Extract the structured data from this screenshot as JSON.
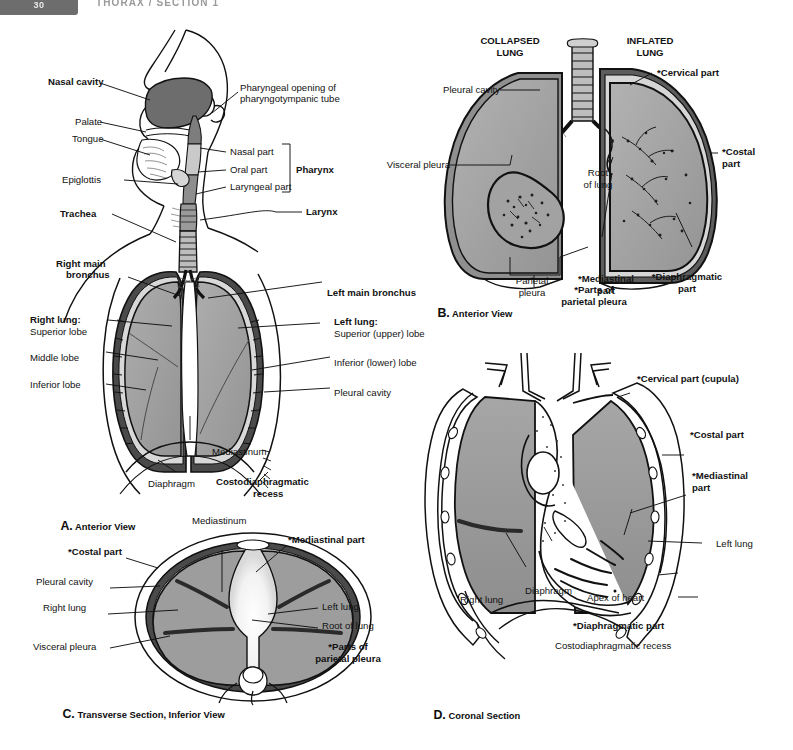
{
  "header": {
    "page_tab": "30",
    "title": "THORAX / SECTION 1"
  },
  "figure": {
    "panels": [
      {
        "id": "A",
        "letter": "A.",
        "caption": "Anterior View",
        "labels": [
          "Nasal cavity",
          "Pharyngeal opening of",
          "pharyngotympanic tube",
          "Palate",
          "Tongue",
          "Nasal part",
          "Oral part",
          "Laryngeal part",
          "Pharynx",
          "Epiglottis",
          "Larynx",
          "Trachea",
          "Right main",
          "bronchus",
          "Left main bronchus",
          "Right lung:",
          "Superior lobe",
          "Middle lobe",
          "Inferior lobe",
          "Left lung:",
          "Superior (upper) lobe",
          "Inferior (lower) lobe",
          "Pleural cavity",
          "Mediastinum",
          "Diaphragm",
          "Costodiaphragmatic",
          "recess"
        ]
      },
      {
        "id": "B",
        "letter": "B.",
        "caption": "Anterior View",
        "labels": [
          "COLLAPSED",
          "LUNG",
          "INFLATED",
          "LUNG",
          "Pleural cavity",
          "Visceral pleura",
          "Root",
          "of lung",
          "Parietal",
          "pleura",
          "*Cervical part",
          "*Costal",
          "part",
          "*Mediastinal",
          "part",
          "*Diaphragmatic",
          "part",
          "*Parts of",
          "parietal pleura"
        ]
      },
      {
        "id": "C",
        "letter": "C.",
        "caption": "Transverse Section, Inferior View",
        "labels": [
          "Mediastinum",
          "*Mediastinal part",
          "*Costal part",
          "Pleural cavity",
          "Right lung",
          "Visceral pleura",
          "Left lung",
          "Root of lung",
          "*Parts of",
          "parietal pleura"
        ]
      },
      {
        "id": "D",
        "letter": "D.",
        "caption": "Coronal Section",
        "labels": [
          "*Cervical part (cupula)",
          "*Costal part",
          "*Mediastinal",
          "part",
          "Left lung",
          "Right lung",
          "Diaphragm",
          "Apex of heart",
          "*Diaphragmatic part",
          "Costodiaphragmatic recess"
        ]
      }
    ]
  },
  "panelA": {
    "nasal_cavity": "Nasal cavity",
    "pharyngeal_opening_1": "Pharyngeal opening of",
    "pharyngeal_opening_2": "pharyngotympanic tube",
    "palate": "Palate",
    "tongue": "Tongue",
    "nasal_part": "Nasal part",
    "oral_part": "Oral part",
    "laryngeal_part": "Laryngeal part",
    "pharynx": "Pharynx",
    "epiglottis": "Epiglottis",
    "larynx": "Larynx",
    "trachea": "Trachea",
    "right_main_1": "Right main",
    "right_main_2": "bronchus",
    "left_main": "Left main bronchus",
    "right_lung_head": "Right lung:",
    "superior_lobe": "Superior lobe",
    "middle_lobe": "Middle lobe",
    "inferior_lobe": "Inferior lobe",
    "left_lung_head": "Left lung:",
    "superior_upper": "Superior (upper) lobe",
    "inferior_lower": "Inferior (lower) lobe",
    "pleural_cavity": "Pleural cavity",
    "mediastinum": "Mediastinum",
    "diaphragm": "Diaphragm",
    "costo_1": "Costodiaphragmatic",
    "costo_2": "recess",
    "letter": "A.",
    "caption": "Anterior View"
  },
  "panelB": {
    "collapsed_1": "COLLAPSED",
    "collapsed_2": "LUNG",
    "inflated_1": "INFLATED",
    "inflated_2": "LUNG",
    "pleural_cavity": "Pleural cavity",
    "visceral_pleura": "Visceral pleura",
    "root_1": "Root",
    "root_2": "of lung",
    "parietal_1": "Parietal",
    "parietal_2": "pleura",
    "cervical_part": "*Cervical part",
    "costal_1": "*Costal",
    "costal_2": "part",
    "mediastinal_1": "*Mediastinal",
    "mediastinal_2": "part",
    "diaphragmatic_1": "*Diaphragmatic",
    "diaphragmatic_2": "part",
    "parts_1": "*Parts of",
    "parts_2": "parietal pleura",
    "letter": "B.",
    "caption": "Anterior View"
  },
  "panelC": {
    "mediastinum": "Mediastinum",
    "mediastinal_part": "*Mediastinal part",
    "costal_part": "*Costal part",
    "pleural_cavity": "Pleural cavity",
    "right_lung": "Right lung",
    "visceral_pleura": "Visceral pleura",
    "left_lung": "Left lung",
    "root_of_lung": "Root of lung",
    "parts_1": "*Parts of",
    "parts_2": "parietal pleura",
    "letter": "C.",
    "caption": "Transverse Section, Inferior View"
  },
  "panelD": {
    "cervical_part": "*Cervical part (cupula)",
    "costal_part": "*Costal part",
    "mediastinal_1": "*Mediastinal",
    "mediastinal_2": "part",
    "left_lung": "Left lung",
    "right_lung": "Right lung",
    "diaphragm": "Diaphragm",
    "apex_of_heart": "Apex of heart",
    "diaphragmatic_part": "*Diaphragmatic part",
    "costo_recess": "Costodiaphragmatic recess",
    "letter": "D.",
    "caption": "Coronal Section"
  },
  "colors": {
    "lung_fill": "#9d9d9d",
    "lung_fill_light": "#b4b4b4",
    "pleura_dark": "#3a3a3a",
    "outline": "#111111",
    "nasal_fill": "#6a6a6a",
    "header_gray": "#6d6d6d",
    "page_bg": "#ffffff"
  }
}
